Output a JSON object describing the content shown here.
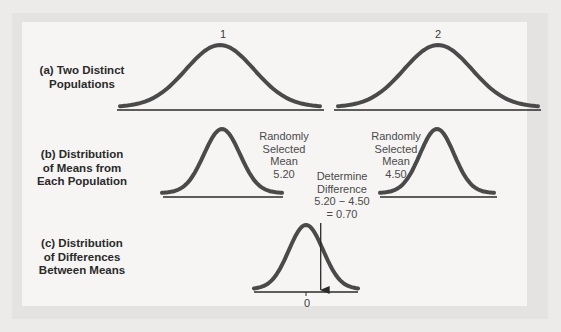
{
  "rows": {
    "a": {
      "label_line1": "(a) Two Distinct",
      "label_line2": "Populations"
    },
    "b": {
      "label_line1": "(b) Distribution",
      "label_line2": "of Means from",
      "label_line3": "Each Population"
    },
    "c": {
      "label_line1": "(c) Distribution",
      "label_line2": "of Differences",
      "label_line3": "Between Means"
    }
  },
  "populations": [
    {
      "id": "1",
      "label": "1"
    },
    {
      "id": "2",
      "label": "2"
    }
  ],
  "sample_means": [
    {
      "line1": "Randomly",
      "line2": "Selected",
      "line3": "Mean",
      "value": "5.20"
    },
    {
      "line1": "Randomly",
      "line2": "Selected",
      "line3": "Mean",
      "value": "4.50"
    }
  ],
  "difference": {
    "line1": "Determine",
    "line2": "Difference",
    "expression": "5.20 − 4.50",
    "result": "= 0.70",
    "zero_label": "0",
    "value": 0.7
  },
  "colors": {
    "curve": "#4a4a4a",
    "axis": "#2a2a2a"
  }
}
